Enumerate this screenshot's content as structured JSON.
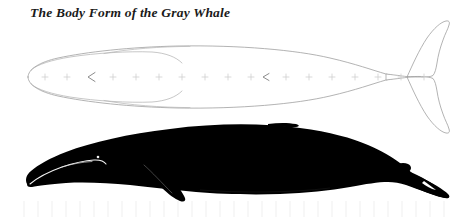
{
  "figure": {
    "title": "The Body Form of the Gray Whale",
    "background_color": "#ffffff",
    "views": [
      {
        "id": "dorsal",
        "label": "dorsal-view",
        "style": "outline",
        "outline_color": "#9a9a9a",
        "fill_color": "#ffffff",
        "stroke_width": 0.7
      },
      {
        "id": "lateral",
        "label": "lateral-view",
        "style": "silhouette",
        "fill_color": "#000000",
        "detail_line_color": "#f2f2f2"
      }
    ],
    "centerline": {
      "label": "dorsal-centerline-marks",
      "mark_glyph": "+",
      "mark_color": "#c8c8c8",
      "y": 77,
      "x_start": 38,
      "x_end": 440,
      "count": 22,
      "arrow_glyph": "<",
      "arrow_color": "#808080",
      "arrow_positions": [
        92,
        266
      ]
    },
    "scale_bar": {
      "label": "scale-ruler",
      "tick_color": "#f0f0f0",
      "y_top": 200,
      "y_bottom": 218,
      "x_start": 22,
      "x_end": 452,
      "tick_count": 30
    }
  }
}
